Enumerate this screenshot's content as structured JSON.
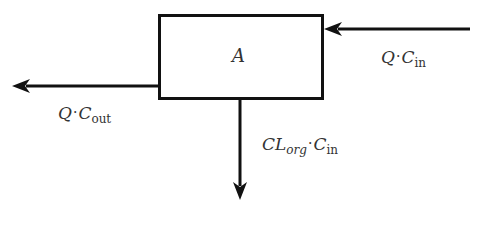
{
  "diagram": {
    "box": {
      "label": "A",
      "x": 158,
      "y": 14,
      "width": 166,
      "height": 86
    },
    "stroke_color": "#111111",
    "text_color": "#333333",
    "flows": {
      "inflow": {
        "direction": "left",
        "var1": "Q",
        "dot": "·",
        "var2": "C",
        "sub": "in"
      },
      "outflow": {
        "direction": "left",
        "var1": "Q",
        "dot": "·",
        "var2": "C",
        "sub": "out"
      },
      "clearance": {
        "direction": "down",
        "var1": "CL",
        "var1_sub": "org",
        "dot": "·",
        "var2": "C",
        "sub": "in"
      }
    }
  }
}
